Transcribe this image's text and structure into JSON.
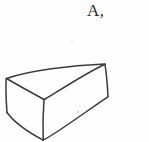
{
  "figure": {
    "label": "A,",
    "caption_position": "top-right",
    "background_color": "#fefefe",
    "stroke_color": "#3a3a3a",
    "stroke_width": 1.4,
    "shape_name": "wedge-block",
    "faces": [
      {
        "name": "top-face",
        "vertices": "6,78 105,64 44,99"
      },
      {
        "name": "left-face",
        "vertices": "6,78 44,99 43,140 7,112"
      },
      {
        "name": "right-face",
        "vertices": "44,99 105,64 108,97 43,140"
      }
    ],
    "vertices": {
      "left": "6,78",
      "top_right": "105,64",
      "front_top": "44,99",
      "bottom": "43,140",
      "left_lower": "7,112",
      "right_lower": "108,97"
    },
    "edges": [
      {
        "name": "top-back-edge",
        "from": "6,78",
        "to": "105,64"
      },
      {
        "name": "top-diagonal-edge",
        "from": "105,64",
        "to": "44,99"
      },
      {
        "name": "top-left-edge",
        "from": "6,78",
        "to": "44,99"
      },
      {
        "name": "left-vertical-edge",
        "from": "6,78",
        "to": "7,112"
      },
      {
        "name": "front-vertical-edge",
        "from": "44,99",
        "to": "43,140"
      },
      {
        "name": "right-vertical-edge",
        "from": "105,64",
        "to": "108,97"
      },
      {
        "name": "bottom-left-edge",
        "from": "7,112",
        "to": "43,140"
      },
      {
        "name": "bottom-right-edge",
        "from": "43,140",
        "to": "108,97"
      }
    ],
    "stray_marks": [
      {
        "name": "faint-speck-upper",
        "x": 72,
        "y": 42
      },
      {
        "name": "faint-speck-lower",
        "x": 78,
        "y": 112
      }
    ]
  }
}
